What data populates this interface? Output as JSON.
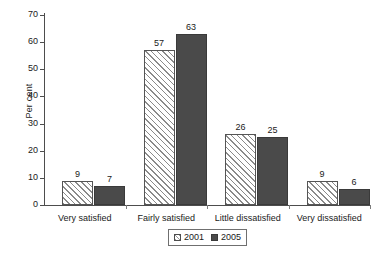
{
  "chart_data": {
    "type": "bar",
    "title": "",
    "xlabel": "",
    "ylabel": "Per cent",
    "ylim": [
      0,
      70
    ],
    "ytick_values": [
      0,
      10,
      20,
      30,
      40,
      50,
      60,
      70
    ],
    "ytick_labels": [
      "0",
      "10",
      "20",
      "30",
      "40",
      "50",
      "60",
      "70"
    ],
    "grid": false,
    "legend_position": "bottom-center",
    "categories": [
      "Very satisfied",
      "Fairly satisfied",
      "Little dissatisfied",
      "Very dissatisfied"
    ],
    "series": [
      {
        "name": "2001",
        "values": [
          9,
          57,
          26,
          9
        ],
        "labels": [
          "9",
          "57",
          "26",
          "9"
        ],
        "color": "#ffffff",
        "pattern": "diagonal-hatch"
      },
      {
        "name": "2005",
        "values": [
          7,
          63,
          25,
          6
        ],
        "labels": [
          "7",
          "63",
          "25",
          "6"
        ],
        "color": "#4a4a4a",
        "pattern": "solid"
      }
    ]
  },
  "legend": {
    "items": [
      {
        "label": "2001"
      },
      {
        "label": "2005"
      }
    ]
  },
  "axis": {
    "y_label": "Per cent"
  }
}
